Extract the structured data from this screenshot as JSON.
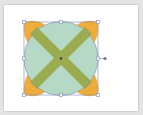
{
  "canvas": {
    "background": "#e4e4e4",
    "artboard_color": "#ffffff"
  },
  "shape": {
    "type": "circle-with-x",
    "circle_fill": "#b5d9c6",
    "x_fill": "#9aaa4a",
    "petal_fill": "#f0ac3a",
    "selection_stroke": "#8a98b8"
  },
  "selection": {
    "handles": 8,
    "rotation_handle": true
  }
}
